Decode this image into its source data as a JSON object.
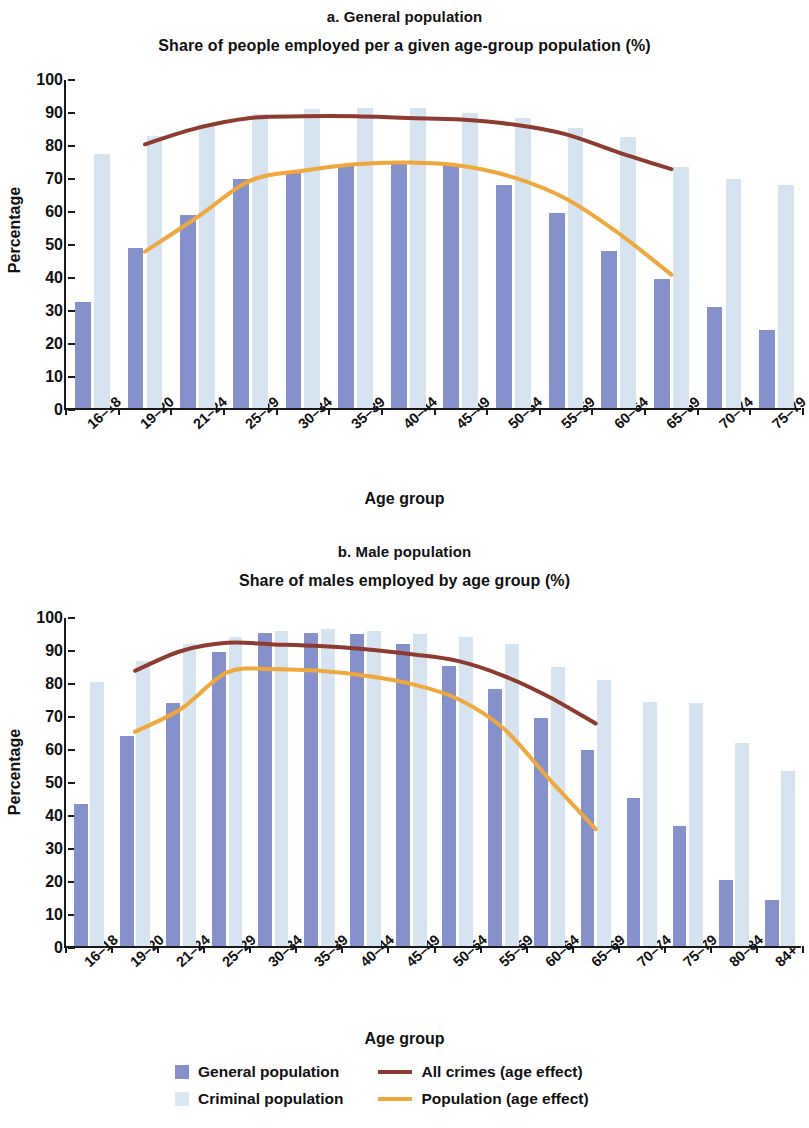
{
  "figure": {
    "y_axis_title": "Percentage",
    "x_axis_title": "Age group"
  },
  "legend": {
    "items": [
      {
        "name": "general-population",
        "label": "General population",
        "type": "bar",
        "color": "#8491cd"
      },
      {
        "name": "criminal-population",
        "label": "Criminal population",
        "type": "bar",
        "color": "#dbe8f4"
      },
      {
        "name": "all-crimes-age-effect",
        "label": "All crimes (age effect)",
        "type": "line",
        "color": "#8e3a2e"
      },
      {
        "name": "population-age-effect",
        "label": "Population (age effect)",
        "type": "line",
        "color": "#f0a73c"
      }
    ]
  },
  "chart_data": [
    {
      "type": "bar",
      "panel": "a",
      "title": "a. General population",
      "subtitle": "Share of people employed per a given age-group population (%)",
      "xlabel": "Age group",
      "ylabel": "Percentage",
      "ylim": [
        0,
        100
      ],
      "yticks": [
        0,
        10,
        20,
        30,
        40,
        50,
        60,
        70,
        80,
        90,
        100
      ],
      "grid": false,
      "legend_position": "bottom",
      "categories": [
        "16–18",
        "19–20",
        "21–24",
        "25–29",
        "30–34",
        "35–39",
        "40–44",
        "45–49",
        "50–54",
        "55–59",
        "60–64",
        "65–69",
        "70–74",
        "75–79"
      ],
      "series": [
        {
          "name": "General population",
          "kind": "bar",
          "color": "#8491cd",
          "values": [
            32,
            48.5,
            58.5,
            69.5,
            71.5,
            73.5,
            74.5,
            73.5,
            67.5,
            59,
            47.5,
            39,
            30.5,
            23.5
          ]
        },
        {
          "name": "Criminal population",
          "kind": "bar",
          "color": "#d6e4f2",
          "values": [
            77,
            82.5,
            86,
            89,
            90.5,
            91,
            91,
            89.5,
            88,
            85,
            82,
            73,
            69.5,
            67.5
          ]
        },
        {
          "name": "All crimes (age effect)",
          "kind": "line",
          "color": "#8e3a2e",
          "x": [
            "19–20",
            "21–24",
            "25–29",
            "30–34",
            "35–39",
            "40–44",
            "45–49",
            "50–54",
            "55–59",
            "60–64",
            "65–69"
          ],
          "values": [
            80.5,
            85.5,
            88.5,
            89,
            89,
            88.5,
            88,
            86.5,
            83.5,
            78,
            73
          ]
        },
        {
          "name": "Population (age effect)",
          "kind": "line",
          "color": "#f0a73c",
          "x": [
            "19–20",
            "21–24",
            "25–29",
            "30–34",
            "35–39",
            "40–44",
            "45–49",
            "50–54",
            "55–59",
            "60–64",
            "65–69"
          ],
          "values": [
            48,
            58.5,
            69.5,
            72.5,
            74.5,
            75,
            74,
            70.5,
            64,
            53.5,
            41
          ]
        }
      ]
    },
    {
      "type": "bar",
      "panel": "b",
      "title": "b. Male population",
      "subtitle": "Share of males employed by age group (%)",
      "xlabel": "Age group",
      "ylabel": "Percentage",
      "ylim": [
        0,
        100
      ],
      "yticks": [
        0,
        10,
        20,
        30,
        40,
        50,
        60,
        70,
        80,
        90,
        100
      ],
      "grid": false,
      "legend_position": "bottom",
      "categories": [
        "16–18",
        "19–20",
        "21–24",
        "25–29",
        "30–34",
        "35–39",
        "40–44",
        "45–49",
        "50–54",
        "55–59",
        "60–64",
        "65–69",
        "70–74",
        "75–79",
        "80–84",
        "84+"
      ],
      "series": [
        {
          "name": "General population",
          "kind": "bar",
          "color": "#8491cd",
          "values": [
            43,
            63.5,
            73.5,
            89,
            95,
            95,
            94.5,
            91.5,
            85,
            78,
            69,
            59.5,
            45,
            36.5,
            20,
            14
          ]
        },
        {
          "name": "Criminal population",
          "kind": "bar",
          "color": "#d6e4f2",
          "values": [
            80,
            86.5,
            91.5,
            93.5,
            95.5,
            96,
            95.5,
            94.5,
            93.5,
            91.5,
            84.5,
            80.5,
            74,
            73.5,
            61.5,
            53
          ]
        },
        {
          "name": "All crimes (age effect)",
          "kind": "line",
          "color": "#8e3a2e",
          "x": [
            "19–20",
            "21–24",
            "25–29",
            "30–34",
            "35–39",
            "40–44",
            "45–49",
            "50–54",
            "55–59",
            "60–64",
            "65–69"
          ],
          "values": [
            84,
            90,
            92.5,
            92,
            91.5,
            90.5,
            89,
            87,
            82.5,
            76,
            68
          ]
        },
        {
          "name": "Population (age effect)",
          "kind": "line",
          "color": "#f0a73c",
          "x": [
            "19–20",
            "21–24",
            "25–29",
            "30–34",
            "35–39",
            "40–44",
            "45–49",
            "50–54",
            "55–59",
            "60–64",
            "65–69"
          ],
          "values": [
            65.5,
            72.5,
            83.5,
            84.5,
            84,
            82.5,
            80,
            75.5,
            66.5,
            51,
            36
          ]
        }
      ]
    }
  ]
}
